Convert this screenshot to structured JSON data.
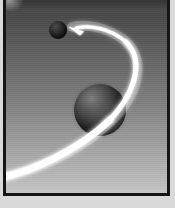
{
  "scene": {
    "title": "Orbital Trajectory Illustration",
    "description": "A bright white curved arrow sweeps around a large dark shaded sphere and points toward a small dark sphere in the upper left, against a vertical gray gradient background inside a dark frame.",
    "canvas_width": 175,
    "canvas_height": 208,
    "background": {
      "name": "vertical-gray-gradient",
      "top_color": "#4a4a4a",
      "mid_color": "#828282",
      "bottom_color": "#c4c4c4",
      "direction": "top-to-bottom"
    },
    "frame": {
      "name": "dark-picture-frame",
      "border_color": "#151515",
      "border_width_px": 3,
      "mat_color": "#d9d9d9"
    },
    "objects": [
      {
        "name": "large-sphere",
        "kind": "sphere",
        "center_x": 97,
        "center_y": 110,
        "radius": 26,
        "surface_color": "#2b2b2b",
        "highlight_color": "#7e7e7e",
        "light_direction": "upper-left"
      },
      {
        "name": "small-sphere",
        "kind": "sphere",
        "center_x": 55,
        "center_y": 30,
        "radius": 9,
        "surface_color": "#1f1f1f",
        "highlight_color": "#4b4b4b",
        "light_direction": "upper-left"
      },
      {
        "name": "trajectory-arc",
        "kind": "curved-arrow",
        "stroke_color": "#ffffff",
        "glow_color": "#f2f2f2",
        "max_stroke_px": 7,
        "min_stroke_px": 2,
        "start_point": [
          4,
          176
        ],
        "end_point": [
          70,
          30
        ],
        "apex_point": [
          141,
          76
        ],
        "direction": "counter-clockwise",
        "arrowhead": {
          "name": "arrowhead",
          "tip_x": 68,
          "tip_y": 28,
          "length": 12,
          "color": "#ffffff"
        }
      }
    ],
    "highlight_color": "#ffffff",
    "accent_color": "#151515"
  }
}
